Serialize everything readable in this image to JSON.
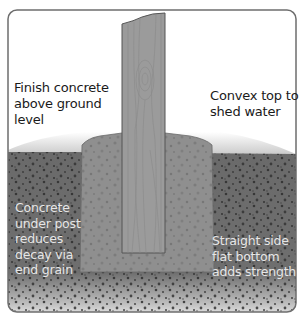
{
  "diagram": {
    "labels": {
      "finish_concrete": [
        "Finish concrete",
        "above ground",
        "level"
      ],
      "convex_top": [
        "Convex top to",
        "shed water"
      ],
      "concrete_under_post": [
        "Concrete",
        "under post",
        "reduces",
        "decay via",
        "end grain"
      ],
      "straight_side": [
        "Straight side",
        "flat bottom",
        "adds strength"
      ]
    },
    "colors": {
      "frame": "#6e6e6e",
      "post": "#9a9a9a",
      "post_outline": "#5a5a5a",
      "concrete": "#8f8f8f",
      "soil": "#6a6a6a",
      "ground_fade": "#c8c8c8",
      "text_dark": "#1a1a1a",
      "text_light": "#e6e6e6"
    }
  }
}
